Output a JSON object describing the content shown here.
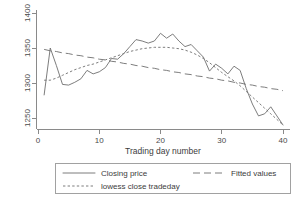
{
  "chart_data": {
    "type": "line",
    "title": "",
    "xlabel": "Trading day number",
    "ylabel": "",
    "xlim": [
      0,
      40
    ],
    "ylim": [
      1230,
      1400
    ],
    "xticks": [
      0,
      10,
      20,
      30,
      40
    ],
    "xtick_labels": [
      "0",
      "10",
      "20",
      "30",
      "40"
    ],
    "yticks": [
      1250,
      1300,
      1350,
      1400
    ],
    "ytick_labels": [
      "1250",
      "1300",
      "1350",
      "1400"
    ],
    "grid": false,
    "legend_position": "below-axis",
    "x": [
      1,
      2,
      3,
      4,
      5,
      6,
      7,
      8,
      9,
      10,
      11,
      12,
      13,
      14,
      15,
      16,
      17,
      18,
      19,
      20,
      21,
      22,
      23,
      24,
      25,
      26,
      27,
      28,
      29,
      30,
      31,
      32,
      33,
      34,
      35,
      36,
      37,
      38,
      39,
      40
    ],
    "series": [
      {
        "name": "Closing price",
        "style": "solid",
        "values": [
          1283,
          1350,
          1325,
          1298,
          1297,
          1301,
          1306,
          1318,
          1313,
          1316,
          1322,
          1335,
          1334,
          1342,
          1352,
          1362,
          1360,
          1357,
          1360,
          1371,
          1364,
          1370,
          1360,
          1352,
          1355,
          1346,
          1337,
          1317,
          1327,
          1321,
          1313,
          1324,
          1318,
          1292,
          1270,
          1253,
          1256,
          1266,
          1253,
          1240
        ]
      },
      {
        "name": "Fitted values",
        "style": "long-dash",
        "values": [
          1348,
          1346,
          1345,
          1343,
          1342,
          1340,
          1339,
          1337,
          1336,
          1334,
          1333,
          1331,
          1330,
          1328,
          1327,
          1325,
          1324,
          1322,
          1321,
          1319,
          1318,
          1316,
          1315,
          1313,
          1312,
          1310,
          1309,
          1307,
          1306,
          1304,
          1303,
          1301,
          1300,
          1298,
          1297,
          1295,
          1294,
          1292,
          1291,
          1289
        ]
      },
      {
        "name": "lowess close tradeday",
        "style": "short-dash",
        "values": [
          1304,
          1304,
          1307,
          1311,
          1315,
          1319,
          1322,
          1325,
          1327,
          1330,
          1333,
          1336,
          1339,
          1342,
          1345,
          1347,
          1349,
          1350,
          1351,
          1351,
          1351,
          1350,
          1349,
          1347,
          1344,
          1340,
          1335,
          1329,
          1322,
          1315,
          1309,
          1303,
          1296,
          1288,
          1280,
          1272,
          1264,
          1256,
          1248,
          1240
        ]
      }
    ]
  },
  "legend": {
    "items": [
      {
        "label": "Closing price",
        "style": "solid"
      },
      {
        "label": "Fitted values",
        "style": "long-dash"
      },
      {
        "label": "lowess close tradeday",
        "style": "short-dash"
      }
    ]
  }
}
